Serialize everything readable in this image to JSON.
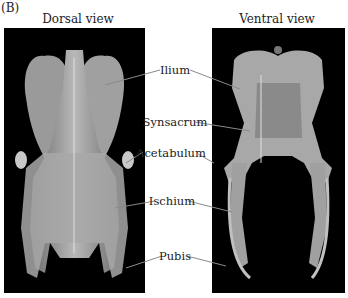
{
  "panel_label": "(B)",
  "views": [
    {
      "title": "Dorsal view"
    },
    {
      "title": "Ventral view"
    }
  ],
  "labels": [
    {
      "text": "Ilium"
    },
    {
      "text": "Synsacrum"
    },
    {
      "text": "Acetabulum"
    },
    {
      "text": "Ischium"
    },
    {
      "text": "Pubis"
    }
  ],
  "colors": {
    "background": "#ffffff",
    "photo_bg": "#000000",
    "bone": "#b8b8b8",
    "leader_line": "#888888"
  }
}
